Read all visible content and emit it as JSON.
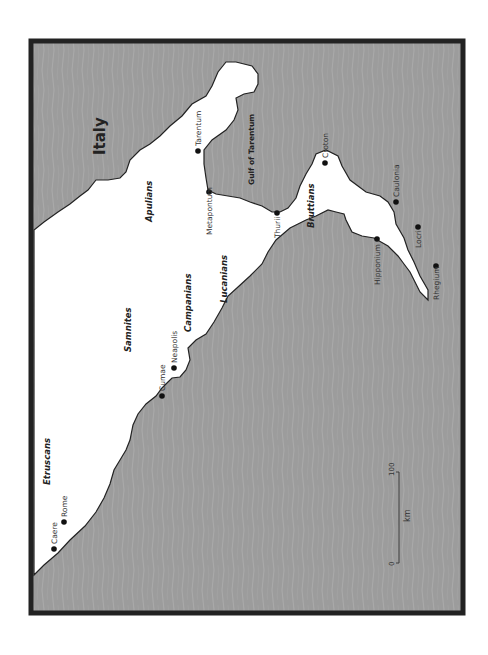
{
  "map": {
    "title": "Italy",
    "orientation": "rotated 90° counter-clockwise (text reads bottom-to-top)",
    "colors": {
      "sea": "#9a9a9a",
      "land": "#ffffff",
      "frame": "#222222",
      "coastline": "#222222"
    },
    "water_labels": [
      {
        "name": "Gulf of Tarentum"
      }
    ],
    "peoples": [
      {
        "name": "Etruscans"
      },
      {
        "name": "Samnites"
      },
      {
        "name": "Campanians"
      },
      {
        "name": "Apulians"
      },
      {
        "name": "Lucanians"
      },
      {
        "name": "Bruttians"
      }
    ],
    "cities": [
      {
        "name": "Caere"
      },
      {
        "name": "Rome"
      },
      {
        "name": "Cumae"
      },
      {
        "name": "Neapolis"
      },
      {
        "name": "Tarentum"
      },
      {
        "name": "Metapontum"
      },
      {
        "name": "Thurii"
      },
      {
        "name": "Croton"
      },
      {
        "name": "Caulonia"
      },
      {
        "name": "Hipponium"
      },
      {
        "name": "Locri"
      },
      {
        "name": "Rhegium"
      }
    ],
    "scale_bar": {
      "start": "0",
      "end": "100",
      "unit": "km"
    }
  }
}
